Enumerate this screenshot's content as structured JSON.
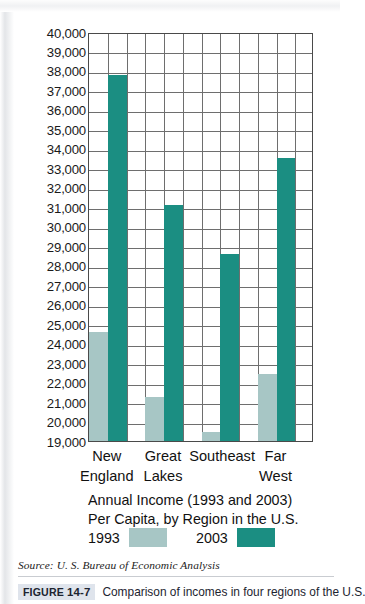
{
  "chart_data": {
    "type": "bar",
    "title": "Annual Income (1993 and 2003) Per Capita, by Region in the U.S.",
    "title_line1": "Annual Income (1993 and 2003)",
    "title_line2": "Per Capita, by Region in the U.S.",
    "xlabel": "",
    "ylabel": "",
    "ylim": [
      19000,
      40000
    ],
    "ytick_step": 1000,
    "grid": true,
    "legend_position": "bottom",
    "categories": [
      "New England",
      "Great Lakes",
      "Southeast",
      "Far West"
    ],
    "category_lines": [
      {
        "line1": "New",
        "line2": "England"
      },
      {
        "line1": "Great",
        "line2": "Lakes"
      },
      {
        "line1": "Southeast",
        "line2": ""
      },
      {
        "line1": "Far",
        "line2": "West"
      }
    ],
    "ytick_labels": [
      "40,000",
      "39,000",
      "38,000",
      "37,000",
      "36,000",
      "35,000",
      "34,000",
      "33,000",
      "32,000",
      "31,000",
      "30,000",
      "29,000",
      "28,000",
      "27,000",
      "26,000",
      "25,000",
      "24,000",
      "23,000",
      "22,000",
      "21,000",
      "20,000",
      "19,000"
    ],
    "series": [
      {
        "name": "1993",
        "color": "#a7c6c5",
        "values": [
          24600,
          21250,
          19450,
          22450
        ]
      },
      {
        "name": "2003",
        "color": "#1b8e82",
        "values": [
          37800,
          31100,
          28600,
          33550
        ]
      }
    ]
  },
  "legend": {
    "items": [
      {
        "label": "1993",
        "color": "#a7c6c5"
      },
      {
        "label": "2003",
        "color": "#1b8e82"
      }
    ]
  },
  "source": "Source: U. S. Bureau of Economic Analysis",
  "caption": {
    "tag_word": "FIGURE",
    "tag_number": "14-7",
    "text": "Comparison of incomes in four regions of the U.S."
  }
}
